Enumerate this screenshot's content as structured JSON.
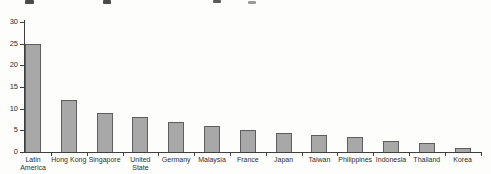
{
  "page": {
    "background": "#fdfdfc"
  },
  "cropped_title_fragments": [
    {
      "x": 25,
      "y": 0,
      "w": 9,
      "h": 4,
      "color": "#4a4a4a"
    },
    {
      "x": 103,
      "y": 0,
      "w": 8,
      "h": 4,
      "color": "#4a4a4a"
    },
    {
      "x": 213,
      "y": 0,
      "w": 8,
      "h": 3,
      "color": "#5a5a5a"
    },
    {
      "x": 248,
      "y": 1,
      "w": 8,
      "h": 3,
      "color": "#9a9a9a"
    }
  ],
  "chart_data": {
    "type": "bar",
    "title": "",
    "xlabel": "",
    "ylabel": "",
    "categories": [
      "Latin America",
      "Hong Kong",
      "Singapore",
      "United State",
      "Germany",
      "Malaysia",
      "France",
      "Japan",
      "Taiwan",
      "Philippines",
      "Indonesia",
      "Thailand",
      "Korea"
    ],
    "label_lines": [
      [
        "Latin",
        "America"
      ],
      [
        "Hong Kong"
      ],
      [
        "Singapore"
      ],
      [
        "United",
        "State"
      ],
      [
        "Germany"
      ],
      [
        "Malaysia"
      ],
      [
        "France"
      ],
      [
        "Japan"
      ],
      [
        "Taiwan"
      ],
      [
        "Philippines"
      ],
      [
        "Indonesia"
      ],
      [
        "Thailand"
      ],
      [
        "Korea"
      ]
    ],
    "values": [
      25,
      12,
      9,
      8,
      7,
      6,
      5,
      4.5,
      4,
      3.5,
      2.5,
      2,
      1
    ],
    "ylim": [
      0,
      30
    ],
    "yticks": [
      0,
      5,
      10,
      15,
      20,
      25,
      30
    ],
    "grid": false,
    "legend": "none",
    "bar_fill": "#a8a8a8",
    "bar_border": "#5e5e5e",
    "axis_color": "#3f3f3f",
    "label_color": "#2e2e2e"
  }
}
